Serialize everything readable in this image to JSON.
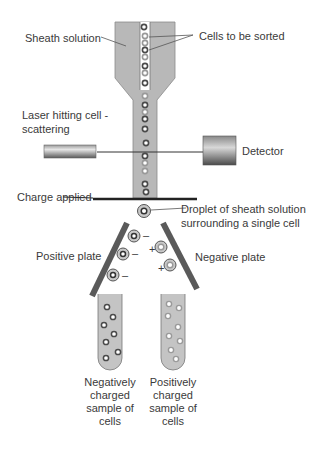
{
  "diagram": {
    "labels": {
      "sheath_solution": "Sheath solution",
      "cells_to_be_sorted": "Cells to be sorted",
      "laser_line1": "Laser hitting cell -",
      "laser_line2": "scattering",
      "detector": "Detector",
      "charge_applied": "Charge applied",
      "droplet_line1": "Droplet of sheath solution",
      "droplet_line2": "surrounding a single cell",
      "positive_plate": "Positive plate",
      "negative_plate": "Negative plate",
      "neg_sample_line1": "Negatively",
      "neg_sample_line2": "charged",
      "neg_sample_line3": "sample of",
      "neg_sample_line4": "cells",
      "pos_sample_line1": "Positively",
      "pos_sample_line2": "charged",
      "pos_sample_line3": "sample of",
      "pos_sample_line4": "cells"
    },
    "charge_signs": {
      "negative": "–",
      "positive": "+"
    },
    "colors": {
      "nozzle_fill": "#b8b8b8",
      "channel_fill": "#ffffff",
      "cell_dark": "#555555",
      "cell_light": "#aaaaaa",
      "plate": "#555555",
      "tube_fill": "#c4c4c4"
    }
  }
}
